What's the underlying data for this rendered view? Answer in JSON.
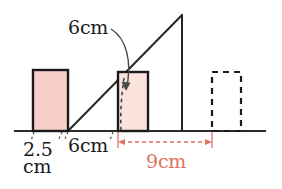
{
  "figure": {
    "canvas": {
      "width": 282,
      "height": 189,
      "background": "#ffffff"
    },
    "colors": {
      "stroke": "#1a1a1a",
      "rect_fill": "#f6cfc8",
      "rect_fill_light": "#fae2dd",
      "dimension_red": "#e0705f",
      "baseline": "#2b2b2b"
    },
    "labels": {
      "hypotenuse_distance": "6cm",
      "left_rect_width_value": "2.5",
      "left_rect_width_unit": "cm",
      "base_segment": "6cm",
      "red_dimension": "9cm"
    },
    "geometry": {
      "baseline": {
        "x1": 14,
        "y1": 131,
        "x2": 266,
        "y2": 131
      },
      "triangle": {
        "base_vertex": {
          "x": 68,
          "y": 131
        },
        "apex": {
          "x": 182,
          "y": 15
        },
        "right_vertex": {
          "x": 182,
          "y": 131
        }
      },
      "left_rect": {
        "x": 33,
        "y": 70,
        "w": 35,
        "h": 61,
        "fill": "#f6cfc8",
        "style": "solid"
      },
      "middle_rect": {
        "x": 118,
        "y": 72,
        "w": 30,
        "h": 59,
        "fill": "#fae2dd",
        "style": "solid"
      },
      "dashed_rect": {
        "x": 212,
        "y": 72,
        "w": 29,
        "h": 59,
        "fill": "none",
        "style": "dashed"
      },
      "inner_dashed_line": {
        "x1": 124,
        "y1": 78,
        "x2": 121,
        "y2": 130
      },
      "curved_arrow": {
        "from": {
          "x": 113,
          "y": 28
        },
        "to": {
          "x": 124,
          "y": 103
        }
      },
      "red_dimension_line": {
        "x1": 118,
        "y": 142,
        "x2": 212
      },
      "tick_marks": [
        {
          "x": 33,
          "y": 131
        },
        {
          "x": 56,
          "y": 131
        },
        {
          "x": 68,
          "y": 131
        },
        {
          "x": 110,
          "y": 131
        },
        {
          "x": 118,
          "y": 131
        }
      ]
    }
  }
}
